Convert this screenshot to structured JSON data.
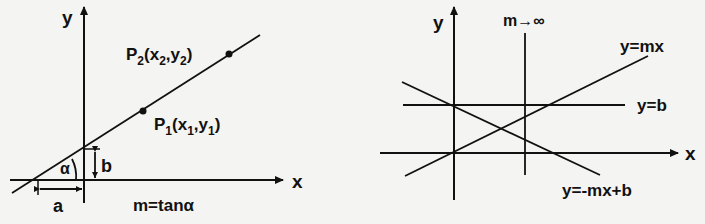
{
  "figure": {
    "left_panel": {
      "axis_x_label": "x",
      "axis_y_label": "y",
      "point_2_label": "P",
      "point_2_sub": "2",
      "point_2_coords": "(x",
      "point_2_coords_sub1": "2",
      "point_2_coords_mid": ",y",
      "point_2_coords_sub2": "2",
      "point_2_coords_end": ")",
      "point_1_label": "P",
      "point_1_sub": "1",
      "point_1_coords": "(x",
      "point_1_coords_sub1": "1",
      "point_1_coords_mid": ",y",
      "point_1_coords_sub2": "1",
      "point_1_coords_end": ")",
      "angle_label": "α",
      "intercept_y_label": "b",
      "intercept_x_label": "a",
      "formula": "m=tanα"
    },
    "right_panel": {
      "axis_x_label": "x",
      "axis_y_label": "y",
      "vertical_line_label": "m→∞",
      "line_mx_label": "y=mx",
      "line_b_label": "y=b",
      "line_neg_label": "y=-mx+b"
    },
    "colors": {
      "ink": "#111111",
      "paper": "#f4f4f2"
    }
  }
}
